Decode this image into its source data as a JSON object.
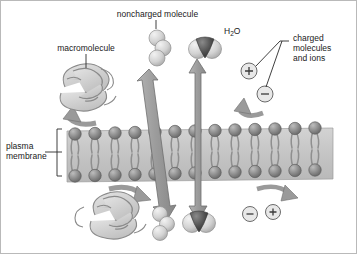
{
  "figure": {
    "background": "#ffffff",
    "border_color": "#b9b9b9"
  },
  "labels": {
    "noncharged_molecule": "noncharged molecule",
    "water": "H",
    "water_sub": "2",
    "water_o": "O",
    "macromolecule": "macromolecule",
    "charged": "charged\nmolecules\nand ions",
    "plasma_membrane": "plasma\nmembrane"
  },
  "ions": {
    "plus": "+",
    "minus": "−"
  },
  "colors": {
    "head": "#8e8e8e",
    "head_dark": "#6f6f6f",
    "tail": "#9a9a9a",
    "membrane_band": "#c9c9c9",
    "arrow": "#9e9e9e",
    "arrow_stroke": "#6e6e6e",
    "sphere_light": "#dcdcdc",
    "sphere_dark": "#585858",
    "macromolecule": "#d2d2d2",
    "leader": "#2a2a2a",
    "text": "#1a1a1a"
  },
  "diagram_data": {
    "type": "diagram",
    "membrane": {
      "x": 66,
      "y": 127,
      "width": 266,
      "height": 54,
      "lipid_count": 13,
      "description": "phospholipid bilayer, heads outward, tails inward"
    },
    "transport_arrows": [
      {
        "name": "noncharged-molecule-arrow",
        "double_headed": true,
        "crosses_membrane": true,
        "tilt": "slanted"
      },
      {
        "name": "water-arrow",
        "double_headed": true,
        "crosses_membrane": true,
        "tilt": "vertical"
      }
    ],
    "blocked_arrows": [
      {
        "name": "macromolecule-blocked-arrow-top",
        "position": "above-membrane-left"
      },
      {
        "name": "macromolecule-blocked-arrow-bottom",
        "position": "below-membrane-left"
      },
      {
        "name": "ion-blocked-arrow-top",
        "position": "above-membrane-right"
      },
      {
        "name": "ion-blocked-arrow-bottom",
        "position": "below-membrane-right"
      }
    ],
    "permeable": [
      "noncharged molecule",
      "H2O"
    ],
    "impermeable": [
      "macromolecule",
      "charged molecules and ions"
    ]
  }
}
